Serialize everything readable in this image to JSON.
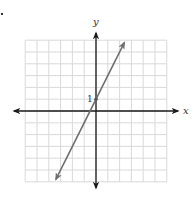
{
  "chart_data": {
    "type": "line",
    "title": "",
    "xlabel": "x",
    "ylabel": "y",
    "xlim": [
      -6,
      6
    ],
    "ylim": [
      -6,
      6
    ],
    "grid": true,
    "grid_step": 1,
    "tick_labels": [
      {
        "axis": "y",
        "value": 1,
        "label": "1"
      }
    ],
    "series": [
      {
        "name": "y = 2x + 1",
        "slope": 2,
        "intercept": 1,
        "x": [
          -3.4,
          2.4
        ],
        "y": [
          -5.8,
          5.8
        ],
        "arrows": "both",
        "color": "#6e6e6e"
      }
    ],
    "points": [
      {
        "x": 0,
        "y": 1
      }
    ],
    "legend": null
  },
  "labels": {
    "x_axis": "x",
    "y_axis": "y",
    "y_tick_1": "1"
  },
  "colors": {
    "grid": "#d9d9d9",
    "axis": "#1a1a1a",
    "line": "#6e6e6e"
  }
}
